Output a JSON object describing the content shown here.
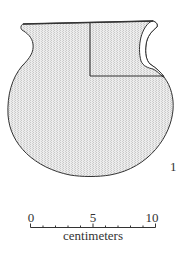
{
  "figure": {
    "vessel_number": "1",
    "fill_color": "#e6e6e6",
    "outline_color": "#333333"
  },
  "scale_bar": {
    "tick_labels": [
      "0",
      "5",
      "10"
    ],
    "unit_label": "centimeters",
    "minor_divisions": 10
  }
}
